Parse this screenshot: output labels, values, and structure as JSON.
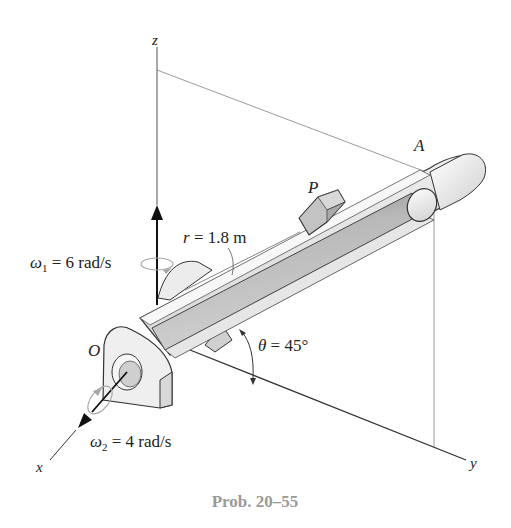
{
  "figure": {
    "caption": "Prob. 20–55",
    "axes": {
      "x_label": "x",
      "y_label": "y",
      "z_label": "z"
    },
    "points": {
      "origin_label": "O",
      "end_label": "A",
      "block_label": "P"
    },
    "annotations": {
      "omega1_symbol": "ω",
      "omega1_sub": "1",
      "omega1_value": " = 6 rad/s",
      "omega2_symbol": "ω",
      "omega2_sub": "2",
      "omega2_value": " = 4 rad/s",
      "r_symbol": "r",
      "r_value": " = 1.8 m",
      "theta_symbol": "θ",
      "theta_value": " = 45°"
    },
    "colors": {
      "line": "#222222",
      "guide_line": "#9a9a9a",
      "tube_light": "#ededed",
      "tube_mid": "#c9c9c9",
      "tube_dark": "#9c9c9c",
      "caption": "#9a9a9a"
    }
  }
}
